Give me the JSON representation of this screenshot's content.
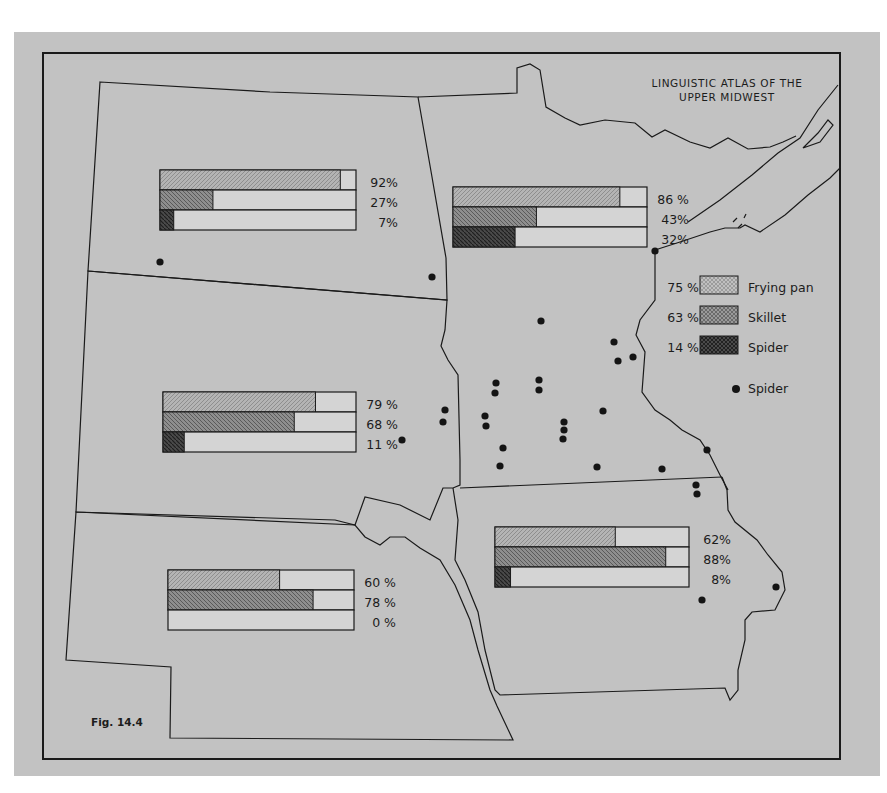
{
  "title": {
    "line1": "LINGUISTIC ATLAS OF THE",
    "line2": "UPPER MIDWEST"
  },
  "figure_label": "Fig.  14.4",
  "legend": {
    "items": [
      {
        "pct": "75 %",
        "label": "Frying pan",
        "pattern": "frying"
      },
      {
        "pct": "63 %",
        "label": "Skillet",
        "pattern": "skillet"
      },
      {
        "pct": "14 %",
        "label": "Spider",
        "pattern": "spider"
      }
    ],
    "dot_label": "Spider"
  },
  "colors": {
    "background": "#c2c2c2",
    "line": "#1a1a1a",
    "bar_empty": "#d4d4d4",
    "frying": "#a8a8a8",
    "skillet": "#7e7e7e",
    "spider": "#3e3e3e"
  },
  "chart_data": {
    "type": "bar",
    "title": "LINGUISTIC ATLAS OF THE UPPER MIDWEST",
    "subtitle": "Fig. 14.4",
    "categories": [
      "Frying pan",
      "Skillet",
      "Spider"
    ],
    "series": [
      {
        "name": "North Dakota",
        "values": [
          92,
          27,
          7
        ]
      },
      {
        "name": "Minnesota",
        "values": [
          86,
          43,
          32
        ]
      },
      {
        "name": "South Dakota",
        "values": [
          79,
          68,
          11
        ]
      },
      {
        "name": "Nebraska",
        "values": [
          60,
          78,
          0
        ]
      },
      {
        "name": "Iowa",
        "values": [
          62,
          88,
          8
        ]
      },
      {
        "name": "Total (legend)",
        "values": [
          75,
          63,
          14
        ]
      }
    ],
    "ylim": [
      0,
      100
    ],
    "legend_position": "right-middle",
    "annotations": "Black dots mark locations where 'Spider' was recorded"
  },
  "regions": [
    {
      "name": "north-dakota",
      "bars": [
        {
          "term": "frying",
          "value": 92,
          "label": "92%"
        },
        {
          "term": "skillet",
          "value": 27,
          "label": "27%"
        },
        {
          "term": "spider",
          "value": 7,
          "label": "7%"
        }
      ]
    },
    {
      "name": "minnesota",
      "bars": [
        {
          "term": "frying",
          "value": 86,
          "label": "86 %"
        },
        {
          "term": "skillet",
          "value": 43,
          "label": "43%"
        },
        {
          "term": "spider",
          "value": 32,
          "label": "32%"
        }
      ]
    },
    {
      "name": "south-dakota",
      "bars": [
        {
          "term": "frying",
          "value": 79,
          "label": "79 %"
        },
        {
          "term": "skillet",
          "value": 68,
          "label": "68 %"
        },
        {
          "term": "spider",
          "value": 11,
          "label": "11 %"
        }
      ]
    },
    {
      "name": "nebraska",
      "bars": [
        {
          "term": "frying",
          "value": 60,
          "label": "60 %"
        },
        {
          "term": "skillet",
          "value": 78,
          "label": "78 %"
        },
        {
          "term": "spider",
          "value": 0,
          "label": "0 %"
        }
      ]
    },
    {
      "name": "iowa",
      "bars": [
        {
          "term": "frying",
          "value": 62,
          "label": "62%"
        },
        {
          "term": "skillet",
          "value": 88,
          "label": "88%"
        },
        {
          "term": "spider",
          "value": 8,
          "label": "8%"
        }
      ]
    }
  ],
  "spider_dots": [
    [
      160,
      262
    ],
    [
      432,
      277
    ],
    [
      655,
      251
    ],
    [
      541,
      321
    ],
    [
      614,
      342
    ],
    [
      618,
      361
    ],
    [
      633,
      357
    ],
    [
      496,
      383
    ],
    [
      495,
      393
    ],
    [
      539,
      380
    ],
    [
      539,
      390
    ],
    [
      445,
      410
    ],
    [
      443,
      422
    ],
    [
      485,
      416
    ],
    [
      486,
      426
    ],
    [
      564,
      422
    ],
    [
      564,
      430
    ],
    [
      563,
      439
    ],
    [
      603,
      411
    ],
    [
      503,
      448
    ],
    [
      500,
      466
    ],
    [
      597,
      467
    ],
    [
      662,
      469
    ],
    [
      707,
      450
    ],
    [
      696,
      485
    ],
    [
      697,
      494
    ],
    [
      402,
      440
    ],
    [
      776,
      587
    ],
    [
      702,
      600
    ]
  ]
}
